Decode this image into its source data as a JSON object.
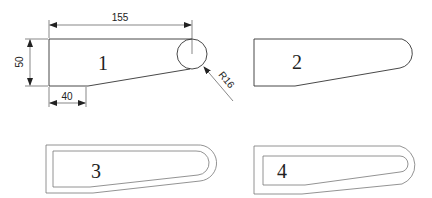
{
  "figure": {
    "title": "",
    "views": [
      {
        "id": 1,
        "label": "1",
        "description": "dimensioned outline"
      },
      {
        "id": 2,
        "label": "2",
        "description": "outline with rounded end"
      },
      {
        "id": 3,
        "label": "3",
        "description": "offset outline (inner smaller)"
      },
      {
        "id": 4,
        "label": "4",
        "description": "offset outline (larger inset)"
      }
    ],
    "dimensions": {
      "length": "155",
      "height": "50",
      "flat_bottom": "40",
      "radius": "R16"
    },
    "colors": {
      "stroke": "#333333",
      "background": "#ffffff"
    }
  }
}
